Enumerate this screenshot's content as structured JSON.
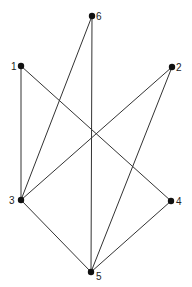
{
  "diagram": {
    "type": "graph",
    "nodes": [
      {
        "id": "1",
        "label": "1",
        "x": 21,
        "y": 66,
        "lx": 11,
        "ly": 70
      },
      {
        "id": "2",
        "label": "2",
        "x": 172,
        "y": 67,
        "lx": 176,
        "ly": 71
      },
      {
        "id": "3",
        "label": "3",
        "x": 21,
        "y": 200,
        "lx": 9,
        "ly": 204
      },
      {
        "id": "4",
        "label": "4",
        "x": 171,
        "y": 201,
        "lx": 176,
        "ly": 205
      },
      {
        "id": "5",
        "label": "5",
        "x": 91,
        "y": 272,
        "lx": 96,
        "ly": 280
      },
      {
        "id": "6",
        "label": "6",
        "x": 92,
        "y": 16,
        "lx": 96,
        "ly": 20
      }
    ],
    "edges": [
      [
        "1",
        "3"
      ],
      [
        "1",
        "4"
      ],
      [
        "6",
        "3"
      ],
      [
        "6",
        "5"
      ],
      [
        "2",
        "3"
      ],
      [
        "2",
        "5"
      ],
      [
        "3",
        "5"
      ],
      [
        "4",
        "5"
      ]
    ]
  }
}
